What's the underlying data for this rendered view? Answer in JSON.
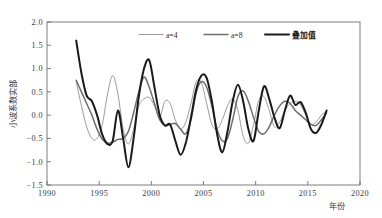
{
  "chart_data": {
    "type": "line",
    "title": "",
    "xlabel": "年份",
    "ylabel": "小波系数实部",
    "xlim": [
      1990,
      2020
    ],
    "ylim": [
      -1.5,
      2.0
    ],
    "xticks": [
      "1990",
      "1995",
      "2000",
      "2005",
      "2010",
      "2015",
      "2020"
    ],
    "xtick_values": [
      1990,
      1995,
      2000,
      2005,
      2010,
      2015,
      2020
    ],
    "yticks": [
      "2.0",
      "1.5",
      "1.0",
      "0.5",
      "0.0",
      "-0.5",
      "-1.0",
      "-1.5"
    ],
    "ytick_values": [
      2.0,
      1.5,
      1.0,
      0.5,
      0.0,
      -0.5,
      -1.0,
      -1.5
    ],
    "grid": false,
    "legend_position": "top-center",
    "x": [
      1992.8,
      1993.3,
      1993.8,
      1994.3,
      1994.8,
      1995.3,
      1995.8,
      1996.3,
      1996.8,
      1997.3,
      1997.8,
      1998.3,
      1998.8,
      1999.3,
      1999.8,
      2000.3,
      2000.8,
      2001.3,
      2001.8,
      2002.3,
      2002.8,
      2003.3,
      2003.8,
      2004.3,
      2004.8,
      2005.3,
      2005.8,
      2006.3,
      2006.8,
      2007.3,
      2007.8,
      2008.3,
      2008.8,
      2009.3,
      2009.8,
      2010.3,
      2010.8,
      2011.3,
      2011.8,
      2012.3,
      2012.8,
      2013.3,
      2013.8,
      2014.3,
      2014.8,
      2015.3,
      2015.8,
      2016.3,
      2016.8
    ],
    "series": [
      {
        "name": "a=4",
        "color": "#8e8e8e",
        "width": 0.9,
        "values": [
          0.72,
          0.2,
          -0.25,
          -0.5,
          -0.5,
          -0.2,
          0.45,
          0.85,
          0.45,
          -0.3,
          -0.62,
          -0.3,
          0.2,
          0.35,
          0.38,
          0.2,
          -0.05,
          0.3,
          0.25,
          -0.1,
          -0.3,
          -0.15,
          0.25,
          0.72,
          0.7,
          0.25,
          -0.2,
          -0.3,
          -0.1,
          0.2,
          0.35,
          0.1,
          -0.45,
          -0.6,
          -0.2,
          0.32,
          0.4,
          0.1,
          -0.25,
          -0.15,
          0.1,
          0.25,
          0.3,
          0.22,
          0.0,
          -0.2,
          -0.15,
          0.0,
          0.08
        ]
      },
      {
        "name": "a=8",
        "color": "#6d6d6d",
        "width": 1.5,
        "values": [
          0.75,
          0.5,
          0.25,
          0.0,
          -0.3,
          -0.52,
          -0.6,
          -0.58,
          -0.52,
          -0.5,
          -0.35,
          0.05,
          0.5,
          0.82,
          0.6,
          0.25,
          -0.1,
          -0.22,
          -0.2,
          -0.18,
          -0.3,
          -0.4,
          -0.1,
          0.48,
          0.72,
          0.6,
          0.2,
          -0.3,
          -0.55,
          -0.5,
          -0.1,
          0.4,
          0.52,
          0.3,
          -0.05,
          -0.35,
          -0.4,
          -0.25,
          0.0,
          0.2,
          0.3,
          0.25,
          0.1,
          0.0,
          -0.1,
          -0.2,
          -0.22,
          -0.1,
          0.05
        ]
      },
      {
        "name": "叠加值",
        "color": "#1a1a1a",
        "width": 2.0,
        "values": [
          1.6,
          0.9,
          0.42,
          0.3,
          0.0,
          -0.42,
          -0.62,
          -0.55,
          0.1,
          -0.5,
          -1.12,
          -0.5,
          0.4,
          1.0,
          1.18,
          0.6,
          0.0,
          -0.22,
          -0.2,
          -0.55,
          -0.85,
          -0.6,
          -0.05,
          0.55,
          0.85,
          0.8,
          0.3,
          -0.4,
          -0.8,
          -0.35,
          0.3,
          0.65,
          0.3,
          -0.3,
          -0.55,
          0.1,
          0.62,
          0.35,
          -0.05,
          -0.28,
          0.1,
          0.42,
          0.22,
          0.28,
          0.05,
          -0.3,
          -0.38,
          -0.2,
          0.1
        ]
      }
    ]
  },
  "legend": {
    "items": [
      {
        "label": "a=4"
      },
      {
        "label": "a=8"
      },
      {
        "label": "叠加值"
      }
    ]
  },
  "axes": {
    "y_title": "小波系数实部",
    "x_title": "年份"
  }
}
